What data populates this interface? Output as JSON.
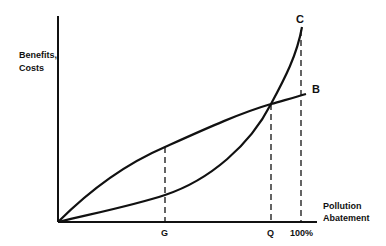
{
  "diagram": {
    "y_axis_label_line1": "Benefits,",
    "y_axis_label_line2": "Costs",
    "x_axis_label_line1": "Pollution",
    "x_axis_label_line2": "Abatement",
    "curves": [
      {
        "name": "B",
        "label": "B",
        "description": "Benefits curve (concave, increasing)"
      },
      {
        "name": "C",
        "label": "C",
        "description": "Costs curve (convex, steeply increasing)"
      }
    ],
    "x_markers": [
      {
        "label": "G",
        "position": "intermediate abatement level"
      },
      {
        "label": "Q",
        "position": "intersection of benefits and costs"
      },
      {
        "label": "100%",
        "position": "full abatement"
      }
    ],
    "colors": {
      "ink": "#111111",
      "background": "#ffffff"
    }
  }
}
